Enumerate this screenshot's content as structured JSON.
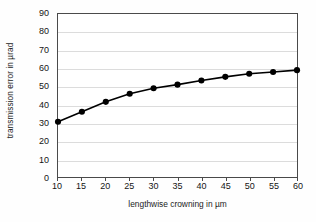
{
  "chart_data": {
    "type": "line",
    "title": "",
    "xlabel": "lengthwise crowning in µm",
    "ylabel": "transmission error in µrad",
    "x": [
      10,
      15,
      20,
      25,
      30,
      35,
      40,
      45,
      50,
      55,
      60
    ],
    "values": [
      30.5,
      36.0,
      41.5,
      46.0,
      49.0,
      51.0,
      53.3,
      55.3,
      57.0,
      58.0,
      59.0
    ],
    "series": [
      {
        "name": "transmission error",
        "values": [
          30.5,
          36.0,
          41.5,
          46.0,
          49.0,
          51.0,
          53.3,
          55.3,
          57.0,
          58.0,
          59.0
        ]
      }
    ],
    "xlim": [
      10,
      60
    ],
    "ylim": [
      0,
      90
    ],
    "xticks": [
      10,
      15,
      20,
      25,
      30,
      35,
      40,
      45,
      50,
      55,
      60
    ],
    "yticks": [
      0,
      10,
      20,
      30,
      40,
      50,
      60,
      70,
      80,
      90
    ],
    "xtick_labels": [
      "10",
      "15",
      "20",
      "25",
      "30",
      "35",
      "40",
      "45",
      "50",
      "55",
      "60"
    ],
    "ytick_labels": [
      "0",
      "10",
      "20",
      "30",
      "40",
      "50",
      "60",
      "70",
      "80",
      "90"
    ],
    "grid": "horizontal",
    "legend": "none",
    "marker": "filled-circle",
    "line_color": "#000000",
    "marker_color": "#000000",
    "grid_color": "#dcdcdc",
    "axis_color": "#4a4a4a",
    "background_color": "#ffffff"
  }
}
